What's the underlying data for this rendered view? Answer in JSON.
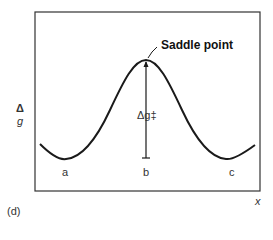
{
  "figure": {
    "panel_label": "(d)",
    "y_axis_label_top": "Δ",
    "y_axis_label_bottom": "g",
    "x_axis_label": "x",
    "annotation": "Saddle point",
    "barrier_label": "Δg‡",
    "positions": [
      "a",
      "b",
      "c"
    ],
    "colors": {
      "line": "#1a1a1a",
      "frame": "#333333",
      "background": "#ffffff"
    }
  }
}
